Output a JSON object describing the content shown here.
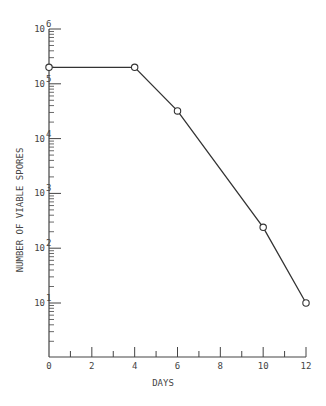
{
  "chart_data": {
    "type": "line",
    "title": "",
    "xlabel": "DAYS",
    "ylabel": "NUMBER OF VIABLE SPORES",
    "yscale": "log",
    "xlim": [
      0,
      12
    ],
    "ylim": [
      1,
      1000000
    ],
    "xticks": [
      0,
      2,
      4,
      6,
      8,
      10,
      12
    ],
    "yticks": [
      "10^1",
      "10^2",
      "10^3",
      "10^4",
      "10^5",
      "10^6"
    ],
    "grid": false,
    "legend": null,
    "marker": "open-circle",
    "series": [
      {
        "name": "viable spores",
        "x": [
          0,
          4,
          6,
          10,
          12
        ],
        "y": [
          200000,
          200000,
          32000,
          240,
          10
        ]
      }
    ]
  },
  "axis": {
    "x_title": "DAYS",
    "y_title": "NUMBER OF VIABLE SPORES",
    "x_tick_labels": [
      "0",
      "2",
      "4",
      "6",
      "8",
      "10",
      "12"
    ],
    "y_tick_labels": [
      {
        "base": "10",
        "exp": "6"
      },
      {
        "base": "10",
        "exp": "5"
      },
      {
        "base": "10",
        "exp": "4"
      },
      {
        "base": "10",
        "exp": "3"
      },
      {
        "base": "10",
        "exp": "2"
      },
      {
        "base": "10",
        "exp": "1"
      }
    ]
  }
}
